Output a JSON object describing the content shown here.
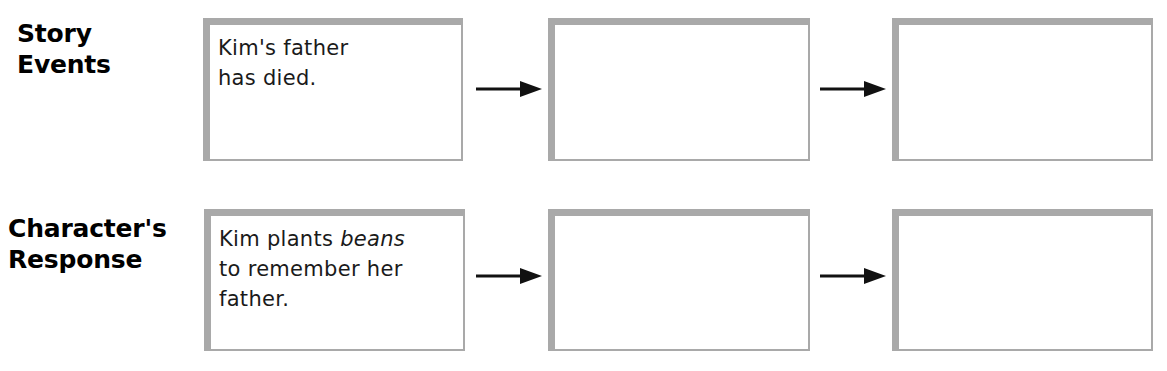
{
  "graphic_organizer": {
    "type": "story-events-character-response-chart",
    "rows": [
      {
        "id": "story-events",
        "label": "Story\nEvents",
        "boxes": [
          {
            "id": "story-events-box-1",
            "text": "Kim's father\nhas died.",
            "filled": true
          },
          {
            "id": "story-events-box-2",
            "text": "",
            "filled": false
          },
          {
            "id": "story-events-box-3",
            "text": "",
            "filled": false
          }
        ],
        "connectors": [
          {
            "id": "story-events-arrow-1",
            "glyph": "right-arrow"
          },
          {
            "id": "story-events-arrow-2",
            "glyph": "right-arrow"
          }
        ]
      },
      {
        "id": "characters-response",
        "label": "Character's\nResponse",
        "boxes": [
          {
            "id": "characters-response-box-1",
            "text_parts": [
              {
                "text": "Kim plants ",
                "style": "normal"
              },
              {
                "text": "beans",
                "style": "italic"
              },
              {
                "text": "\nto remember her\nfather.",
                "style": "normal"
              }
            ],
            "text": "Kim plants beans\nto remember her\nfather.",
            "filled": true
          },
          {
            "id": "characters-response-box-2",
            "text": "",
            "filled": false
          },
          {
            "id": "characters-response-box-3",
            "text": "",
            "filled": false
          }
        ],
        "connectors": [
          {
            "id": "characters-response-arrow-1",
            "glyph": "right-arrow"
          },
          {
            "id": "characters-response-arrow-2",
            "glyph": "right-arrow"
          }
        ]
      }
    ],
    "colors": {
      "box_border": "#a9a9a9",
      "box_shadow": "#b7b7b7",
      "box_fill": "#ffffff",
      "arrow": "#111111",
      "label_text": "#000000",
      "body_text": "#1a1a1a",
      "page_background": "#ffffff"
    }
  }
}
